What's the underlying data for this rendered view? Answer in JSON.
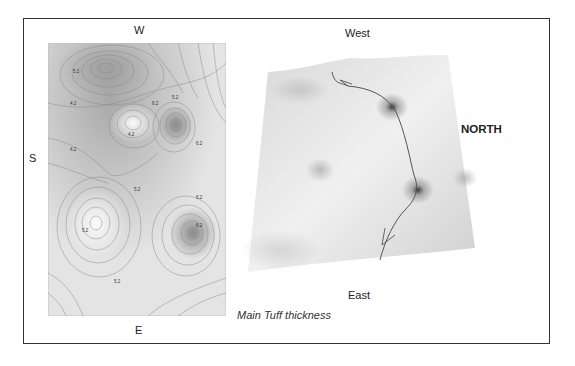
{
  "figure": {
    "caption": "Main Tuff thickness",
    "contour_map": {
      "label_top": "W",
      "label_left": "S",
      "label_bottom": "E",
      "contour_labels": [
        "5.2",
        "4.2",
        "6.2",
        "5.2",
        "4.2",
        "6.2",
        "4.2",
        "5.2",
        "6.2",
        "5.2",
        "6.2",
        "5.2"
      ]
    },
    "surface_3d": {
      "label_top": "West",
      "label_right": "NORTH",
      "label_bottom": "East"
    }
  }
}
